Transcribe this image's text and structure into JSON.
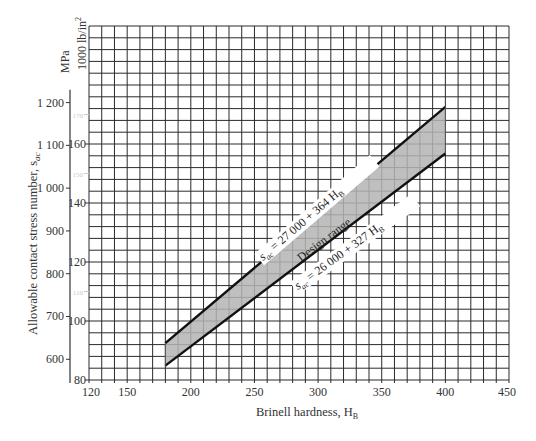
{
  "chart_data": {
    "type": "area",
    "title": "",
    "xlabel": "Brinell hardness, H_B",
    "ylabel": "Allowable contact stress number, s_ac",
    "ylabel_units_primary": "MPa",
    "ylabel_units_secondary": "1000 lb/in²",
    "xlim": [
      120,
      450
    ],
    "ylim_ksi": [
      80,
      200
    ],
    "grid": true,
    "x_ticks": [
      120,
      150,
      200,
      250,
      300,
      350,
      400,
      450
    ],
    "y_ticks_mpa": [
      600,
      700,
      800,
      900,
      1000,
      1100,
      1200
    ],
    "y_tick_labels_mpa": [
      "600",
      "700",
      "800",
      "900",
      "1 000",
      "1 100",
      "1 200"
    ],
    "y_ticks_ksi": [
      80,
      100,
      120,
      140,
      160
    ],
    "y_ticks_ksi_faint": [
      110,
      150,
      170
    ],
    "series": [
      {
        "name": "s_ac = 27 000 + 364 H_B",
        "equation": "27000 + 364*HB (lb/in²)",
        "x": [
          180,
          400
        ],
        "values_ksi": [
          92.52,
          172.6
        ]
      },
      {
        "name": "s_ac = 26 000 + 327 H_B",
        "equation": "26000 + 327*HB (lb/in²)",
        "x": [
          180,
          400
        ],
        "values_ksi": [
          84.86,
          156.8
        ]
      }
    ],
    "band": {
      "label": "Design range",
      "x_range": [
        180,
        400
      ],
      "fill": "#b4b4b4"
    },
    "annotations": [
      {
        "text": "s_ac = 27 000 + 364 H_B",
        "position": "above upper line"
      },
      {
        "text": "Design range",
        "position": "inside band"
      },
      {
        "text": "s_ac = 26 000 + 327 H_B",
        "position": "below lower line"
      }
    ]
  },
  "labels": {
    "x_axis_title": "Brinell hardness, H",
    "x_axis_sub": "B",
    "y_axis_title": "Allowable contact stress number, s",
    "y_axis_sub": "ac",
    "unit_mpa": "MPa",
    "unit_ksi": "1000 lb/in",
    "unit_ksi_sup": "2",
    "upper_eq_prefix": "s",
    "upper_eq_sub": "ac",
    "upper_eq_body": " = 27 000 + 364 H",
    "upper_eq_tail": "B",
    "lower_eq_prefix": "s",
    "lower_eq_sub": "ac",
    "lower_eq_body": " = 26 000 + 327 H",
    "lower_eq_tail": "B",
    "band_label": "Design range"
  },
  "colors": {
    "grid": "#2a2a2a",
    "band": "#b4b4b4",
    "line": "#111111"
  }
}
